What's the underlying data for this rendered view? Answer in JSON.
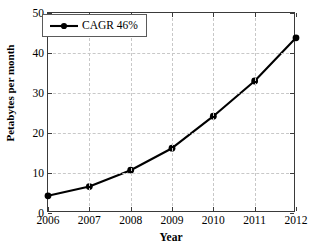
{
  "chart_data": {
    "type": "line",
    "title": "",
    "xlabel": "Year",
    "ylabel": "Petabytes per month",
    "categories": [
      "2006",
      "2007",
      "2008",
      "2009",
      "2010",
      "2011",
      "2012"
    ],
    "x": [
      2006,
      2007,
      2008,
      2009,
      2010,
      2011,
      2012
    ],
    "values": [
      4.3,
      6.6,
      10.7,
      16.2,
      24.2,
      33.0,
      43.8
    ],
    "series": [
      {
        "name": "CAGR 46%",
        "values": [
          4.3,
          6.6,
          10.7,
          16.2,
          24.2,
          33.0,
          43.8
        ],
        "color": "#000000",
        "marker": "filled-circle"
      }
    ],
    "xlim": [
      2006,
      2012
    ],
    "ylim": [
      0,
      50
    ],
    "xticks": [
      "2006",
      "2007",
      "2008",
      "2009",
      "2010",
      "2011",
      "2012"
    ],
    "yticks": [
      "0",
      "10",
      "20",
      "30",
      "40",
      "50"
    ],
    "ytick_values": [
      0,
      10,
      20,
      30,
      40,
      50
    ],
    "grid": true,
    "grid_style": "dashed",
    "grid_color": "#c8c8c8",
    "legend": {
      "position": "top-left",
      "entries": [
        {
          "label": "CAGR 46%",
          "symbol": "line-with-marker",
          "color": "#000000"
        }
      ]
    },
    "axis_color": "#3a3a3a",
    "background": "#ffffff"
  }
}
